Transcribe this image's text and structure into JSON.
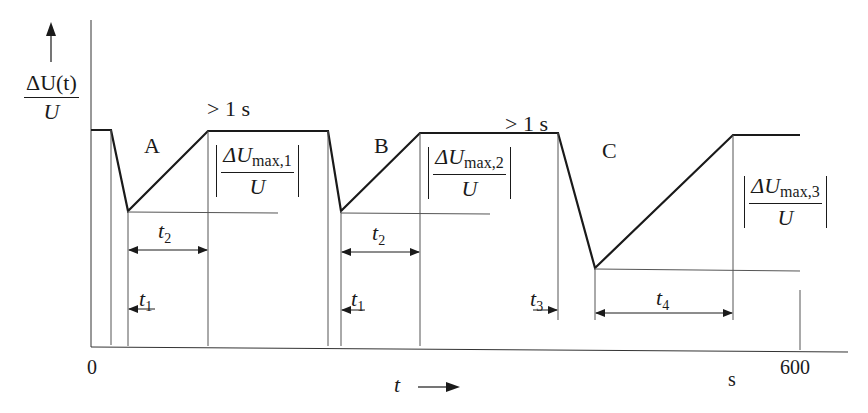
{
  "diagram": {
    "type": "voltage-fluctuation-timing-diagram",
    "y_axis": {
      "label_numerator": "ΔU(t)",
      "label_denominator": "U",
      "arrow": "up"
    },
    "x_axis": {
      "label": "t",
      "arrow": "right",
      "origin_label": "0",
      "end_label": "600",
      "unit_label": "s"
    },
    "events": [
      {
        "id": "A",
        "label": "A",
        "magnitude_numerator_base": "ΔU",
        "magnitude_subscript": "max,1",
        "magnitude_denominator": "U",
        "fall_time_label": "t",
        "fall_time_subscript": "1",
        "recovery_time_label": "t",
        "recovery_time_subscript": "2",
        "gap_label": "> 1 s"
      },
      {
        "id": "B",
        "label": "B",
        "magnitude_numerator_base": "ΔU",
        "magnitude_subscript": "max,2",
        "magnitude_denominator": "U",
        "fall_time_label": "t",
        "fall_time_subscript": "1",
        "recovery_time_label": "t",
        "recovery_time_subscript": "2",
        "gap_label": "> 1 s"
      },
      {
        "id": "C",
        "label": "C",
        "magnitude_numerator_base": "ΔU",
        "magnitude_subscript": "max,3",
        "magnitude_denominator": "U",
        "fall_time_label": "t",
        "fall_time_subscript": "3",
        "recovery_time_label": "t",
        "recovery_time_subscript": "4"
      }
    ],
    "colors": {
      "line": "#1a1a1a",
      "background": "#ffffff"
    }
  }
}
